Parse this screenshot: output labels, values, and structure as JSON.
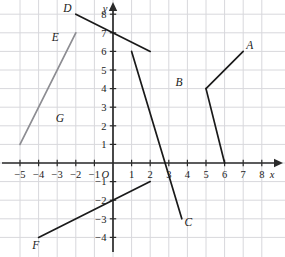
{
  "figure": {
    "axis_labels": {
      "x": "x",
      "y": "y",
      "origin": "O"
    }
  },
  "colors": {
    "grid": "#d8d8dc",
    "axis": "#2b2b2b",
    "segment_dark": "#1a1a1a",
    "segment_gray": "#8d8d92",
    "background": "#ffffff",
    "text": "#1a1a1a"
  },
  "chart_data": {
    "type": "line",
    "xlabel": "x",
    "ylabel": "y",
    "xlim": [
      -5.7,
      8.7
    ],
    "ylim": [
      -4.7,
      8.6
    ],
    "grid": true,
    "legend": "none",
    "xticks": [
      -5,
      -4,
      -3,
      -2,
      -1,
      1,
      2,
      3,
      4,
      5,
      6,
      7,
      8
    ],
    "yticks": [
      -4,
      -3,
      -2,
      -1,
      1,
      2,
      3,
      4,
      5,
      6,
      7,
      8
    ],
    "xtick_labels": [
      "−5",
      "−4",
      "−3",
      "−2",
      "−1",
      "1",
      "2",
      "3",
      "4",
      "5",
      "6",
      "7",
      "8"
    ],
    "ytick_labels": [
      "−4",
      "−3",
      "−2",
      "−1",
      "1",
      "2",
      "3",
      "4",
      "5",
      "6",
      "7",
      "8"
    ],
    "series": [
      {
        "name": "A",
        "label": "A",
        "color": "#1a1a1a",
        "x": [
          5,
          7
        ],
        "y": [
          4,
          6
        ],
        "label_x": 7.35,
        "label_y": 6.35
      },
      {
        "name": "B",
        "label": "B",
        "color": "#1a1a1a",
        "x": [
          5,
          6
        ],
        "y": [
          4,
          0
        ],
        "label_x": 3.55,
        "label_y": 4.35
      },
      {
        "name": "C",
        "label": "C",
        "color": "#1a1a1a",
        "x": [
          1,
          3.7
        ],
        "y": [
          6,
          -3
        ],
        "label_x": 4.05,
        "label_y": -3.15
      },
      {
        "name": "D",
        "label": "D",
        "color": "#1a1a1a",
        "x": [
          -2,
          2
        ],
        "y": [
          8,
          6
        ],
        "label_x": -2.45,
        "label_y": 8.35
      },
      {
        "name": "E",
        "label": "E",
        "color": "#8d8d92",
        "x": [
          -5,
          -2
        ],
        "y": [
          1,
          7
        ],
        "label_x": -3.1,
        "label_y": 6.8
      },
      {
        "name": "F",
        "label": "F",
        "color": "#1a1a1a",
        "x": [
          -4,
          2
        ],
        "y": [
          -4,
          -1
        ],
        "label_x": -4.15,
        "label_y": -4.4
      }
    ],
    "annotations": [
      {
        "name": "G",
        "text": "G",
        "x": -2.85,
        "y": 2.4
      }
    ]
  }
}
